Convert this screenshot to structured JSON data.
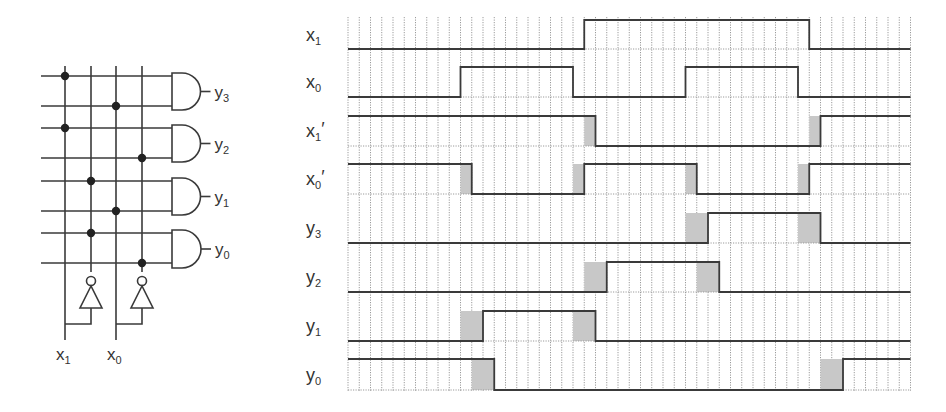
{
  "circuit": {
    "title": "2-to-4 decoder",
    "inputs": [
      {
        "name": "x1",
        "label_main": "x",
        "label_sub": "1",
        "x": 65
      },
      {
        "name": "x0",
        "label_main": "x",
        "label_sub": "0",
        "x": 116
      }
    ],
    "columns": [
      {
        "signal": "x1",
        "x": 65
      },
      {
        "signal": "x1'",
        "x": 91
      },
      {
        "signal": "x0",
        "x": 116
      },
      {
        "signal": "x0'",
        "x": 142
      }
    ],
    "rows_y": [
      76,
      106,
      128,
      158,
      181,
      211,
      233,
      263
    ],
    "dots": [
      {
        "row": 0,
        "col": 0
      },
      {
        "row": 1,
        "col": 2
      },
      {
        "row": 2,
        "col": 0
      },
      {
        "row": 3,
        "col": 3
      },
      {
        "row": 4,
        "col": 1
      },
      {
        "row": 5,
        "col": 2
      },
      {
        "row": 6,
        "col": 1
      },
      {
        "row": 7,
        "col": 3
      }
    ],
    "gates": [
      {
        "output": "y3",
        "label_main": "y",
        "label_sub": "3",
        "top": 73,
        "bottom": 110
      },
      {
        "output": "y2",
        "label_main": "y",
        "label_sub": "2",
        "top": 125,
        "bottom": 162
      },
      {
        "output": "y1",
        "label_main": "y",
        "label_sub": "1",
        "top": 178,
        "bottom": 215
      },
      {
        "output": "y0",
        "label_main": "y",
        "label_sub": "0",
        "top": 230,
        "bottom": 268
      }
    ],
    "inverters": [
      {
        "input": "x1",
        "from_x": 65,
        "to_x": 91
      },
      {
        "input": "x0",
        "from_x": 116,
        "to_x": 142
      }
    ]
  },
  "timing": {
    "grid": {
      "x0": 348,
      "dx": 11.25,
      "steps": 50,
      "top": 17,
      "bottom": 391
    },
    "signals": [
      {
        "name": "x1",
        "label_main": "x",
        "label_sub": "1",
        "prime": false,
        "high_y": 20,
        "low_y": 49,
        "initial": 0,
        "transitions": [
          21,
          41
        ],
        "delays": []
      },
      {
        "name": "x0",
        "label_main": "x",
        "label_sub": "0",
        "prime": false,
        "high_y": 67,
        "low_y": 97,
        "initial": 0,
        "transitions": [
          10,
          20,
          30,
          40
        ],
        "delays": []
      },
      {
        "name": "x1'",
        "label_main": "x",
        "label_sub": "1",
        "prime": true,
        "high_y": 116,
        "low_y": 146,
        "initial": 1,
        "transitions": [
          22,
          42
        ],
        "delays": [
          [
            21,
            22
          ],
          [
            41,
            42
          ]
        ]
      },
      {
        "name": "x0'",
        "label_main": "x",
        "label_sub": "0",
        "prime": true,
        "high_y": 164,
        "low_y": 194,
        "initial": 1,
        "transitions": [
          11,
          21,
          31,
          41
        ],
        "delays": [
          [
            10,
            11
          ],
          [
            20,
            21
          ],
          [
            30,
            31
          ],
          [
            40,
            41
          ]
        ]
      },
      {
        "name": "y3",
        "label_main": "y",
        "label_sub": "3",
        "prime": false,
        "high_y": 213,
        "low_y": 243,
        "initial": 0,
        "transitions": [
          32,
          42
        ],
        "delays": [
          [
            30,
            32
          ],
          [
            40,
            42
          ]
        ]
      },
      {
        "name": "y2",
        "label_main": "y",
        "label_sub": "2",
        "prime": false,
        "high_y": 262,
        "low_y": 292,
        "initial": 0,
        "transitions": [
          23,
          33
        ],
        "delays": [
          [
            21,
            23
          ],
          [
            31,
            33
          ]
        ]
      },
      {
        "name": "y1",
        "label_main": "y",
        "label_sub": "1",
        "prime": false,
        "high_y": 311,
        "low_y": 341,
        "initial": 0,
        "transitions": [
          12,
          22
        ],
        "delays": [
          [
            10,
            12
          ],
          [
            20,
            22
          ]
        ]
      },
      {
        "name": "y0",
        "label_main": "y",
        "label_sub": "0",
        "prime": false,
        "high_y": 359,
        "low_y": 390,
        "initial": 1,
        "transitions": [
          13,
          44
        ],
        "delays": [
          [
            11,
            13
          ],
          [
            42,
            44
          ]
        ]
      }
    ]
  },
  "colors": {
    "wire": "#3a3a3a",
    "grid": "#9a9a9a",
    "delay_fill": "#c8c8c8",
    "text": "#333333"
  }
}
